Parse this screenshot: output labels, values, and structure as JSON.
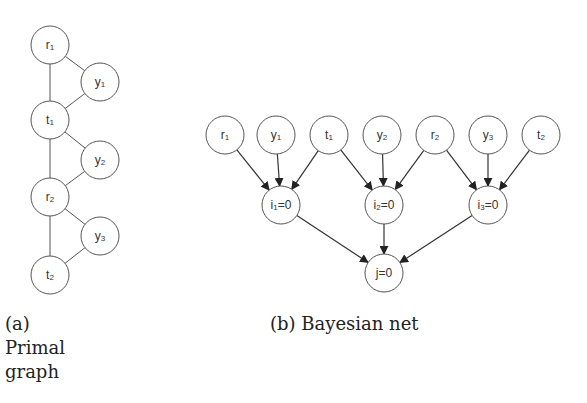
{
  "figure": {
    "panel_a": {
      "caption_label": "(a)",
      "caption_text_line1": "Primal",
      "caption_text_line2": "graph",
      "nodes": [
        {
          "id": "r1",
          "base": "r",
          "sub": "1",
          "cx": 50,
          "cy": 45
        },
        {
          "id": "y1",
          "base": "y",
          "sub": "1",
          "cx": 100,
          "cy": 82
        },
        {
          "id": "t1",
          "base": "t",
          "sub": "1",
          "cx": 50,
          "cy": 120
        },
        {
          "id": "y2",
          "base": "y",
          "sub": "2",
          "cx": 100,
          "cy": 160
        },
        {
          "id": "r2",
          "base": "r",
          "sub": "2",
          "cx": 50,
          "cy": 197
        },
        {
          "id": "y3",
          "base": "y",
          "sub": "3",
          "cx": 100,
          "cy": 236
        },
        {
          "id": "t2",
          "base": "t",
          "sub": "2",
          "cx": 50,
          "cy": 275
        }
      ],
      "edges": [
        [
          "r1",
          "t1"
        ],
        [
          "r1",
          "y1"
        ],
        [
          "t1",
          "y1"
        ],
        [
          "t1",
          "r2"
        ],
        [
          "t1",
          "y2"
        ],
        [
          "r2",
          "y2"
        ],
        [
          "r2",
          "t2"
        ],
        [
          "r2",
          "y3"
        ],
        [
          "t2",
          "y3"
        ]
      ]
    },
    "panel_b": {
      "caption": "(b) Bayesian net",
      "nodes": [
        {
          "id": "r1",
          "base": "r",
          "sub": "1",
          "rest": "",
          "cx": 225,
          "cy": 135
        },
        {
          "id": "y1",
          "base": "y",
          "sub": "1",
          "rest": "",
          "cx": 276,
          "cy": 135
        },
        {
          "id": "t1",
          "base": "t",
          "sub": "1",
          "rest": "",
          "cx": 329,
          "cy": 135
        },
        {
          "id": "y2",
          "base": "y",
          "sub": "2",
          "rest": "",
          "cx": 382,
          "cy": 135
        },
        {
          "id": "r2",
          "base": "r",
          "sub": "2",
          "rest": "",
          "cx": 435,
          "cy": 135
        },
        {
          "id": "y3",
          "base": "y",
          "sub": "3",
          "rest": "",
          "cx": 488,
          "cy": 135
        },
        {
          "id": "t2",
          "base": "t",
          "sub": "2",
          "rest": "",
          "cx": 541,
          "cy": 135
        },
        {
          "id": "i1",
          "base": "i",
          "sub": "1",
          "rest": "=0",
          "cx": 281,
          "cy": 205
        },
        {
          "id": "i2",
          "base": "i",
          "sub": "2",
          "rest": "=0",
          "cx": 384,
          "cy": 205
        },
        {
          "id": "i3",
          "base": "i",
          "sub": "3",
          "rest": "=0",
          "cx": 488,
          "cy": 205
        },
        {
          "id": "j",
          "base": "j",
          "sub": "",
          "rest": "=0",
          "cx": 384,
          "cy": 273
        }
      ],
      "edges": [
        [
          "r1",
          "i1"
        ],
        [
          "y1",
          "i1"
        ],
        [
          "t1",
          "i1"
        ],
        [
          "t1",
          "i2"
        ],
        [
          "y2",
          "i2"
        ],
        [
          "r2",
          "i2"
        ],
        [
          "r2",
          "i3"
        ],
        [
          "y3",
          "i3"
        ],
        [
          "t2",
          "i3"
        ],
        [
          "i1",
          "j"
        ],
        [
          "i2",
          "j"
        ],
        [
          "i3",
          "j"
        ]
      ]
    },
    "node_radius": 19
  }
}
